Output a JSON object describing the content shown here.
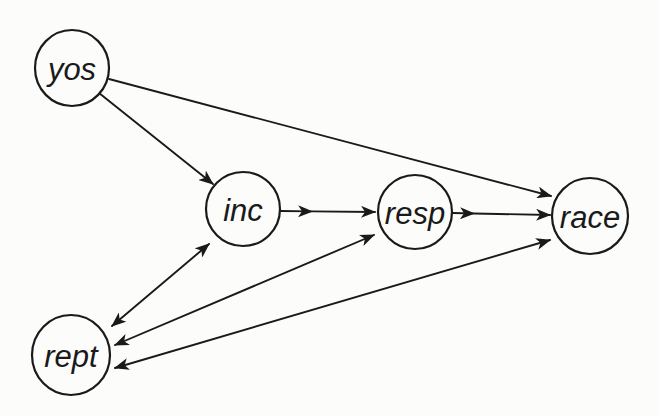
{
  "diagram": {
    "type": "path-diagram",
    "background_color": "#fcfcfb",
    "ink_color": "#1a1a1a",
    "canvas": {
      "width": 658,
      "height": 416
    },
    "nodes": [
      {
        "id": "yos",
        "label": "yos",
        "cx": 72,
        "cy": 68,
        "rx": 37,
        "ry": 38
      },
      {
        "id": "inc",
        "label": "inc",
        "cx": 243,
        "cy": 209,
        "rx": 37,
        "ry": 37
      },
      {
        "id": "resp",
        "label": "resp",
        "cx": 415,
        "cy": 212,
        "rx": 37,
        "ry": 37
      },
      {
        "id": "race",
        "label": "race",
        "cx": 590,
        "cy": 216,
        "rx": 38,
        "ry": 38
      },
      {
        "id": "rept",
        "label": "rept",
        "cx": 71,
        "cy": 355,
        "rx": 39,
        "ry": 40
      }
    ],
    "edges": [
      {
        "id": "yos-inc",
        "from": "yos",
        "to": "inc",
        "bidirectional": false,
        "points": [
          [
            99,
            93
          ],
          [
            213,
            184
          ]
        ],
        "arrow_start": false,
        "arrow_mid": false,
        "arrow_end": true
      },
      {
        "id": "yos-race",
        "from": "yos",
        "to": "race",
        "bidirectional": false,
        "points": [
          [
            109,
            79
          ],
          [
            551,
            196
          ]
        ],
        "arrow_start": false,
        "arrow_mid": false,
        "arrow_end": true
      },
      {
        "id": "inc-resp",
        "from": "inc",
        "to": "resp",
        "bidirectional": false,
        "points": [
          [
            281,
            211
          ],
          [
            312,
            211.4
          ],
          [
            375,
            212
          ]
        ],
        "arrow_start": false,
        "arrow_mid": true,
        "arrow_end": true
      },
      {
        "id": "resp-race",
        "from": "resp",
        "to": "race",
        "bidirectional": false,
        "points": [
          [
            453,
            213
          ],
          [
            474,
            213.5
          ],
          [
            550,
            215
          ]
        ],
        "arrow_start": false,
        "arrow_mid": true,
        "arrow_end": true
      },
      {
        "id": "rept-inc",
        "from": "rept",
        "to": "inc",
        "bidirectional": true,
        "points": [
          [
            112,
            326
          ],
          [
            209,
            244
          ]
        ],
        "arrow_start": true,
        "arrow_mid": false,
        "arrow_end": true
      },
      {
        "id": "rept-resp",
        "from": "rept",
        "to": "resp",
        "bidirectional": true,
        "points": [
          [
            115,
            345
          ],
          [
            374,
            235
          ]
        ],
        "arrow_start": true,
        "arrow_mid": false,
        "arrow_end": true
      },
      {
        "id": "rept-race",
        "from": "rept",
        "to": "race",
        "bidirectional": true,
        "points": [
          [
            115,
            368
          ],
          [
            550,
            240
          ]
        ],
        "arrow_start": true,
        "arrow_mid": false,
        "arrow_end": true
      }
    ]
  }
}
